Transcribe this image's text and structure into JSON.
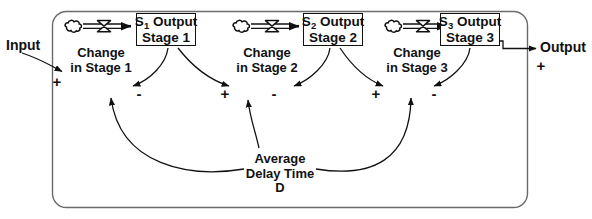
{
  "diagram": {
    "type": "stock-and-flow",
    "boundary": {
      "shape": "rounded-rectangle",
      "label": ""
    },
    "input": {
      "label": "Input",
      "polarity": "+"
    },
    "output": {
      "label": "Output",
      "polarity": "+"
    },
    "stocks": [
      {
        "id": "s1",
        "line1_prefix": "S",
        "line1_sub": "1",
        "line1_suffix": " Output",
        "line2": "Stage 1"
      },
      {
        "id": "s2",
        "line1_prefix": "S",
        "line1_sub": "2",
        "line1_suffix": " Output",
        "line2": "Stage 2"
      },
      {
        "id": "s3",
        "line1_prefix": "S",
        "line1_sub": "3",
        "line1_suffix": " Output",
        "line2": "Stage 3"
      }
    ],
    "flows": [
      {
        "id": "f1",
        "line1": "Change",
        "line2": "in Stage 1"
      },
      {
        "id": "f2",
        "line1": "Change",
        "line2": "in Stage 2"
      },
      {
        "id": "f3",
        "line1": "Change",
        "line2": "in Stage 3"
      }
    ],
    "auxiliary": {
      "line1": "Average",
      "line2": "Delay Time",
      "line3": "D"
    },
    "polarities": [
      {
        "id": "p-in",
        "sign": "+"
      },
      {
        "id": "p-f1-neg",
        "sign": "-"
      },
      {
        "id": "p-f2-pos",
        "sign": "+"
      },
      {
        "id": "p-f2-neg",
        "sign": "-"
      },
      {
        "id": "p-f3-pos",
        "sign": "+"
      },
      {
        "id": "p-f3-neg",
        "sign": "-"
      },
      {
        "id": "p-out",
        "sign": "+"
      }
    ],
    "colors": {
      "stroke": "#111111",
      "fill": "#ffffff",
      "boundary": "#555555"
    }
  }
}
